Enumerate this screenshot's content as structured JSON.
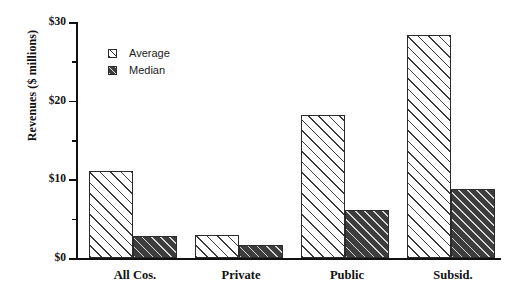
{
  "chart_data": {
    "type": "bar",
    "title": "",
    "xlabel": "",
    "ylabel": "Revenues ($ millions)",
    "categories": [
      "All Cos.",
      "Private",
      "Public",
      "Subsid."
    ],
    "series": [
      {
        "name": "Average",
        "values": [
          11.1,
          2.9,
          18.2,
          28.4
        ]
      },
      {
        "name": "Median",
        "values": [
          2.8,
          1.6,
          6.1,
          8.8
        ]
      }
    ],
    "ylim": [
      0,
      30
    ],
    "ytick_labels": [
      "$0",
      "$10",
      "$20",
      "$30"
    ],
    "ytick_values": [
      0,
      10,
      20,
      30
    ],
    "yminor_values": [
      5,
      15,
      25
    ],
    "grid": false,
    "legend_position": "upper-left-inside",
    "legend_entries": [
      "Average",
      "Median"
    ],
    "colors": {
      "average_fill": "#ffffff",
      "average_hatch": "#3a3a3a",
      "median_fill": "#3d3d3d",
      "median_hatch": "#d8d8d8",
      "axis": "#111111",
      "text": "#111111",
      "background": "#ffffff"
    }
  }
}
